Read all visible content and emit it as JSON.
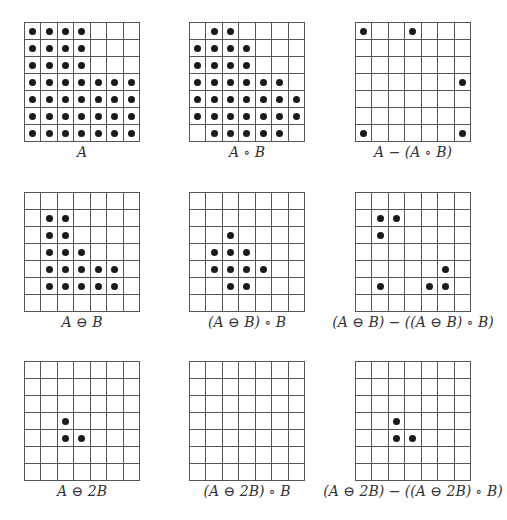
{
  "figure": {
    "grid_size": 7,
    "panels": [
      {
        "id": "A",
        "label": "A",
        "x": 24,
        "y": 22,
        "dots": [
          [
            0,
            0
          ],
          [
            0,
            1
          ],
          [
            0,
            2
          ],
          [
            0,
            3
          ],
          [
            1,
            0
          ],
          [
            1,
            1
          ],
          [
            1,
            2
          ],
          [
            1,
            3
          ],
          [
            2,
            0
          ],
          [
            2,
            1
          ],
          [
            2,
            2
          ],
          [
            2,
            3
          ],
          [
            3,
            0
          ],
          [
            3,
            1
          ],
          [
            3,
            2
          ],
          [
            3,
            3
          ],
          [
            3,
            4
          ],
          [
            3,
            5
          ],
          [
            3,
            6
          ],
          [
            4,
            0
          ],
          [
            4,
            1
          ],
          [
            4,
            2
          ],
          [
            4,
            3
          ],
          [
            4,
            4
          ],
          [
            4,
            5
          ],
          [
            4,
            6
          ],
          [
            5,
            0
          ],
          [
            5,
            1
          ],
          [
            5,
            2
          ],
          [
            5,
            3
          ],
          [
            5,
            4
          ],
          [
            5,
            5
          ],
          [
            5,
            6
          ],
          [
            6,
            0
          ],
          [
            6,
            1
          ],
          [
            6,
            2
          ],
          [
            6,
            3
          ],
          [
            6,
            4
          ],
          [
            6,
            5
          ],
          [
            6,
            6
          ]
        ]
      },
      {
        "id": "A_open_B",
        "label": "A ∘ B",
        "x": 189,
        "y": 22,
        "dots": [
          [
            0,
            1
          ],
          [
            0,
            2
          ],
          [
            1,
            0
          ],
          [
            1,
            1
          ],
          [
            1,
            2
          ],
          [
            1,
            3
          ],
          [
            2,
            0
          ],
          [
            2,
            1
          ],
          [
            2,
            2
          ],
          [
            2,
            3
          ],
          [
            3,
            0
          ],
          [
            3,
            1
          ],
          [
            3,
            2
          ],
          [
            3,
            3
          ],
          [
            3,
            4
          ],
          [
            3,
            5
          ],
          [
            4,
            0
          ],
          [
            4,
            1
          ],
          [
            4,
            2
          ],
          [
            4,
            3
          ],
          [
            4,
            4
          ],
          [
            4,
            5
          ],
          [
            4,
            6
          ],
          [
            5,
            0
          ],
          [
            5,
            1
          ],
          [
            5,
            2
          ],
          [
            5,
            3
          ],
          [
            5,
            4
          ],
          [
            5,
            5
          ],
          [
            5,
            6
          ],
          [
            6,
            1
          ],
          [
            6,
            2
          ],
          [
            6,
            3
          ],
          [
            6,
            4
          ],
          [
            6,
            5
          ]
        ]
      },
      {
        "id": "A_minus_open",
        "label": "A − (A ∘ B)",
        "x": 355,
        "y": 22,
        "dots": [
          [
            0,
            0
          ],
          [
            0,
            3
          ],
          [
            3,
            6
          ],
          [
            6,
            0
          ],
          [
            6,
            6
          ]
        ]
      },
      {
        "id": "A_erode_B",
        "label": "A ⊖ B",
        "x": 24,
        "y": 192,
        "dots": [
          [
            1,
            1
          ],
          [
            1,
            2
          ],
          [
            2,
            1
          ],
          [
            2,
            2
          ],
          [
            3,
            1
          ],
          [
            3,
            2
          ],
          [
            3,
            3
          ],
          [
            4,
            1
          ],
          [
            4,
            2
          ],
          [
            4,
            3
          ],
          [
            4,
            4
          ],
          [
            4,
            5
          ],
          [
            5,
            1
          ],
          [
            5,
            2
          ],
          [
            5,
            3
          ],
          [
            5,
            4
          ],
          [
            5,
            5
          ]
        ]
      },
      {
        "id": "erode_open",
        "label": "(A ⊖ B) ∘ B",
        "x": 189,
        "y": 192,
        "dots": [
          [
            2,
            2
          ],
          [
            3,
            1
          ],
          [
            3,
            2
          ],
          [
            3,
            3
          ],
          [
            4,
            1
          ],
          [
            4,
            2
          ],
          [
            4,
            3
          ],
          [
            4,
            4
          ],
          [
            5,
            2
          ],
          [
            5,
            3
          ]
        ]
      },
      {
        "id": "erode_minus_open",
        "label": "(A ⊖ B) − ((A ⊖ B) ∘ B)",
        "x": 355,
        "y": 192,
        "dots": [
          [
            1,
            1
          ],
          [
            1,
            2
          ],
          [
            2,
            1
          ],
          [
            4,
            5
          ],
          [
            5,
            1
          ],
          [
            5,
            4
          ],
          [
            5,
            5
          ]
        ]
      },
      {
        "id": "A_erode_2B",
        "label": "A ⊖ 2B",
        "x": 24,
        "y": 361,
        "dots": [
          [
            3,
            2
          ],
          [
            4,
            2
          ],
          [
            4,
            3
          ]
        ]
      },
      {
        "id": "erode2_open",
        "label": "(A ⊖ 2B) ∘ B",
        "x": 189,
        "y": 361,
        "dots": []
      },
      {
        "id": "erode2_minus_open",
        "label": "(A ⊖ 2B) − ((A ⊖ 2B) ∘ B)",
        "x": 355,
        "y": 361,
        "dots": [
          [
            3,
            2
          ],
          [
            4,
            2
          ],
          [
            4,
            3
          ]
        ]
      }
    ]
  }
}
